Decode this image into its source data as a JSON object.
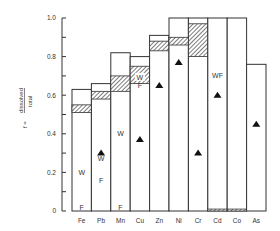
{
  "chart_data": {
    "type": "bar",
    "title": "",
    "xlabel": "",
    "ylabel": "f = dissolved / total",
    "ylabel_parts": {
      "prefix": "f =",
      "numerator": "dissolved",
      "denominator": "total"
    },
    "ylim": [
      0,
      1.0
    ],
    "yticks": [
      0,
      0.2,
      0.4,
      0.6,
      0.8,
      1.0
    ],
    "ytick_labels": [
      "0",
      "0.2",
      "0.4",
      "0.6",
      "0.8",
      "1.0"
    ],
    "grid": false,
    "legend": null,
    "categories": [
      "Fe",
      "Pb",
      "Mn",
      "Cu",
      "Zn",
      "Ni",
      "Cr",
      "Cd",
      "Co",
      "As"
    ],
    "series": [
      {
        "name": "total_fraction",
        "values": [
          0.63,
          0.66,
          0.82,
          0.8,
          0.91,
          1.0,
          1.0,
          1.0,
          1.0,
          0.76
        ]
      },
      {
        "name": "hatched_range_low",
        "values": [
          0.51,
          0.58,
          0.62,
          0.66,
          0.83,
          0.86,
          0.8,
          0.0,
          0.0,
          null
        ]
      },
      {
        "name": "hatched_range_high",
        "values": [
          0.55,
          0.62,
          0.7,
          0.75,
          0.88,
          0.9,
          0.97,
          0.01,
          0.01,
          null
        ]
      },
      {
        "name": "triangle_marker",
        "values": [
          null,
          0.3,
          null,
          0.37,
          0.65,
          0.77,
          0.3,
          0.6,
          null,
          0.45
        ]
      }
    ],
    "annotations": [
      {
        "category": "Fe",
        "text": "W",
        "y": 0.2
      },
      {
        "category": "Fe",
        "text": "F",
        "y": 0.02
      },
      {
        "category": "Pb",
        "text": "W",
        "y": 0.27
      },
      {
        "category": "Pb",
        "text": "F",
        "y": 0.16
      },
      {
        "category": "Mn",
        "text": "W",
        "y": 0.4
      },
      {
        "category": "Mn",
        "text": "F",
        "y": 0.02
      },
      {
        "category": "Cu",
        "text": "W",
        "y": 0.69
      },
      {
        "category": "Cu",
        "text": "F",
        "y": 0.65
      },
      {
        "category": "Cd",
        "text": "WF",
        "y": 0.7
      }
    ]
  },
  "axis": {
    "ytick_labels": [
      "0",
      "0.2",
      "0.4",
      "0.6",
      "0.8",
      "1.0"
    ]
  },
  "ylabel": {
    "prefix": "f =",
    "numerator": "dissolved",
    "denominator": "total"
  }
}
